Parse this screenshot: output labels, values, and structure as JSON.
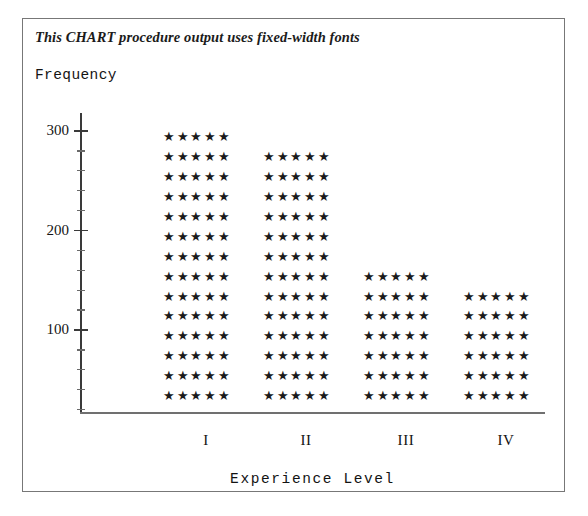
{
  "figure": {
    "title": "This CHART procedure output uses fixed-width fonts",
    "frame_color": "#777777",
    "background": "#ffffff"
  },
  "chart_data": {
    "type": "bar",
    "title": "This CHART procedure output uses fixed-width fonts",
    "subtitle": "",
    "xlabel": "Experience Level",
    "ylabel": "Frequency",
    "categories": [
      "I",
      "II",
      "III",
      "IV"
    ],
    "values": [
      280,
      260,
      140,
      120
    ],
    "star_rows": [
      14,
      13,
      7,
      6
    ],
    "stars_per_row": 5,
    "star_glyph": "★★★★★",
    "units_per_row": 20,
    "ylim": [
      0,
      310
    ],
    "yticks": [
      100,
      200,
      300
    ],
    "ytick_labels": [
      "100",
      "200",
      "300"
    ],
    "minor_yticks": [
      20,
      40,
      60,
      80,
      120,
      140,
      160,
      180,
      220,
      240,
      260,
      280
    ],
    "grid": false,
    "legend": null,
    "orientation": "vertical",
    "note": "Star-block bar chart rendered with fixed-width character cells; each row of 5 stars represents 20 frequency units."
  },
  "axes": {
    "y_title": "Frequency",
    "x_title": "Experience Level",
    "tick_labels": [
      "300",
      "200",
      "100"
    ],
    "category_labels": [
      "I",
      "II",
      "III",
      "IV"
    ],
    "axis_color": "#3a3a3a",
    "x_axis_color": "#707070"
  },
  "columns": [
    {
      "label": "I",
      "rows": 14,
      "row_text": "★★★★★",
      "value": 280
    },
    {
      "label": "II",
      "rows": 13,
      "row_text": "★★★★★",
      "value": 260
    },
    {
      "label": "III",
      "rows": 7,
      "row_text": "★★★★★",
      "value": 140
    },
    {
      "label": "IV",
      "rows": 6,
      "row_text": "★★★★★",
      "value": 120
    }
  ]
}
